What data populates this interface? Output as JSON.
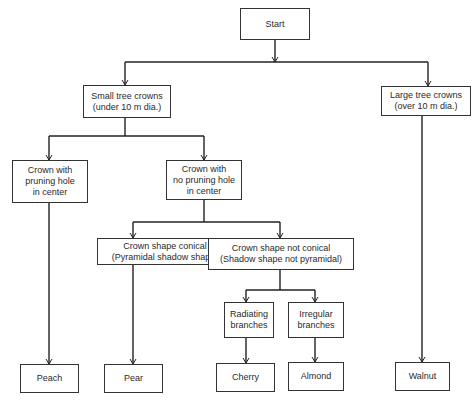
{
  "diagram": {
    "type": "decision-tree",
    "nodes": {
      "start": "Start",
      "small_crowns": "Small tree crowns\n(under 10 m dia.)",
      "large_crowns": "Large tree crowns\n(over 10 m dia.)",
      "pruning_hole": "Crown with\npruning hole\nin center",
      "no_pruning_hole": "Crown with\nno pruning hole\nin center",
      "conical": "Crown shape conical\n(Pyramidal shadow shape)",
      "not_conical": "Crown shape not conical\n(Shadow shape not pyramidal)",
      "radiating": "Radiating\nbranches",
      "irregular": "Irregular\nbranches",
      "peach": "Peach",
      "pear": "Pear",
      "cherry": "Cherry",
      "almond": "Almond",
      "walnut": "Walnut"
    },
    "edges": [
      [
        "Start",
        "Small tree crowns (under 10 m dia.)"
      ],
      [
        "Start",
        "Large tree crowns (over 10 m dia.)"
      ],
      [
        "Small tree crowns (under 10 m dia.)",
        "Crown with pruning hole in center"
      ],
      [
        "Small tree crowns (under 10 m dia.)",
        "Crown with no pruning hole in center"
      ],
      [
        "Crown with no pruning hole in center",
        "Crown shape conical (Pyramidal shadow shape)"
      ],
      [
        "Crown with no pruning hole in center",
        "Crown shape not conical (Shadow shape not pyramidal)"
      ],
      [
        "Crown shape not conical (Shadow shape not pyramidal)",
        "Radiating branches"
      ],
      [
        "Crown shape not conical (Shadow shape not pyramidal)",
        "Irregular branches"
      ],
      [
        "Crown with pruning hole in center",
        "Peach"
      ],
      [
        "Crown shape conical (Pyramidal shadow shape)",
        "Pear"
      ],
      [
        "Radiating branches",
        "Cherry"
      ],
      [
        "Irregular branches",
        "Almond"
      ],
      [
        "Large tree crowns (over 10 m dia.)",
        "Walnut"
      ]
    ]
  }
}
